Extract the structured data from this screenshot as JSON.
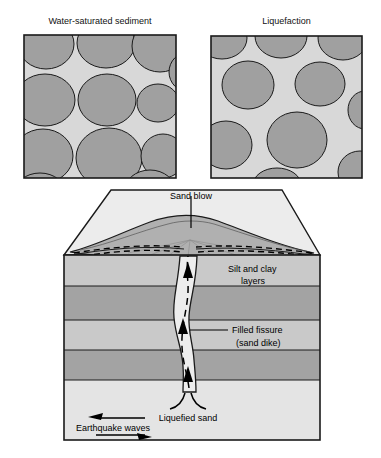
{
  "figure": {
    "panels": [
      {
        "id": "water-saturated-sediment",
        "title": "Water-saturated sediment"
      },
      {
        "id": "liquefaction",
        "title": "Liquefaction"
      }
    ],
    "block_diagram": {
      "labels": {
        "sand_blow": "Sand blow",
        "silt_and_clay_line1": "Silt and clay",
        "silt_and_clay_line2": "layers",
        "filled_fissure_line1": "Filled fissure",
        "filled_fissure_line2": "(sand dike)",
        "liquefied_sand": "Liquefied sand",
        "earthquake_waves": "Earthquake waves"
      },
      "layers": [
        {
          "name": "silt-clay-light-1",
          "fill": "#c9c9c9"
        },
        {
          "name": "silt-clay-dark-1",
          "fill": "#a3a3a3"
        },
        {
          "name": "silt-clay-light-2",
          "fill": "#c9c9c9"
        },
        {
          "name": "silt-clay-dark-2",
          "fill": "#a3a3a3"
        },
        {
          "name": "liquefied-sand-base",
          "fill": "#e4e4e4"
        }
      ]
    },
    "colors": {
      "grain_fill": "#a0a0a0",
      "pore_fill": "#d8d8d8",
      "outline": "#1a1a1a",
      "mound_fill": "#b0b0b0",
      "top_surface_fill": "#ececec",
      "dike_fill": "#ededed"
    }
  }
}
